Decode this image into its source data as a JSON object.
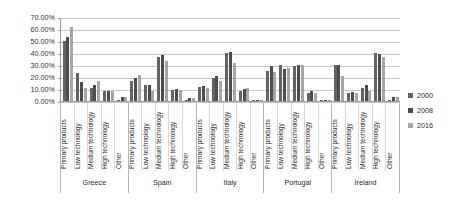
{
  "chart_data": {
    "type": "bar",
    "title": "",
    "xlabel": "",
    "ylabel": "",
    "ylim": [
      0,
      70
    ],
    "ytick_labels": [
      "0.00%",
      "10.00%",
      "20.00%",
      "30.00%",
      "40.00%",
      "50.00%",
      "60.00%",
      "70.00%"
    ],
    "ytick_values": [
      0,
      10,
      20,
      30,
      40,
      50,
      60,
      70
    ],
    "grid": true,
    "legend_position": "right",
    "legend": [
      "2000",
      "2008",
      "2016"
    ],
    "series_colors": [
      "#636363",
      "#4d4d4d",
      "#a6a6a6"
    ],
    "groups": [
      "Greece",
      "Spain",
      "Italy",
      "Portugal",
      "Ireland"
    ],
    "categories": [
      "Primary products",
      "Low technology",
      "Medium technology",
      "High technology",
      "Other"
    ],
    "series": [
      {
        "name": "2000",
        "values": {
          "Greece": [
            50.0,
            23.0,
            11.0,
            8.5,
            1.0
          ],
          "Spain": [
            17.0,
            13.0,
            37.0,
            9.5,
            1.0
          ],
          "Italy": [
            11.5,
            19.5,
            40.0,
            8.5,
            0.8
          ],
          "Portugal": [
            25.0,
            30.0,
            29.0,
            7.0,
            0.3
          ],
          "Ireland": [
            30.0,
            6.5,
            11.0,
            40.0,
            0.8
          ]
        }
      },
      {
        "name": "2008",
        "values": {
          "Greece": [
            53.0,
            15.5,
            13.0,
            8.5,
            3.0
          ],
          "Spain": [
            19.5,
            13.5,
            38.0,
            10.0,
            2.5
          ],
          "Italy": [
            12.5,
            21.0,
            40.5,
            10.0,
            1.0
          ],
          "Portugal": [
            29.5,
            27.0,
            30.0,
            8.5,
            0.4
          ],
          "Ireland": [
            30.0,
            7.5,
            13.0,
            39.0,
            3.0
          ]
        }
      },
      {
        "name": "2016",
        "values": {
          "Greece": [
            62.0,
            11.0,
            17.0,
            8.0,
            3.0
          ],
          "Spain": [
            22.0,
            8.0,
            33.0,
            9.5,
            2.5
          ],
          "Italy": [
            11.0,
            16.5,
            32.0,
            11.0,
            1.0
          ],
          "Portugal": [
            24.5,
            27.5,
            30.0,
            6.5,
            0.4
          ],
          "Ireland": [
            21.0,
            6.5,
            8.0,
            37.0,
            3.0
          ]
        }
      }
    ]
  }
}
